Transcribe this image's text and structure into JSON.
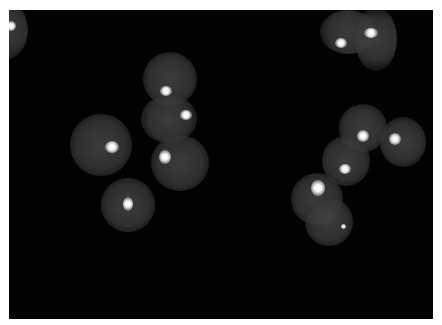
{
  "image": {
    "description": "Fluorescence micrograph of round cell nuclei on a black background, each with a bright focal spot",
    "border_color": "#ffffff",
    "background_color": "#020202",
    "cells": [
      {
        "x": -20,
        "y": 0,
        "w": 48,
        "h": 60,
        "spot": {
          "x": 6,
          "y": 21,
          "w": 10,
          "h": 10
        }
      },
      {
        "x": 143,
        "y": 52,
        "w": 54,
        "h": 54,
        "spot": {
          "x": 160,
          "y": 86,
          "w": 12,
          "h": 10
        }
      },
      {
        "x": 141,
        "y": 95,
        "w": 56,
        "h": 48,
        "spot": {
          "x": 180,
          "y": 110,
          "w": 12,
          "h": 10
        }
      },
      {
        "x": 70,
        "y": 114,
        "w": 62,
        "h": 62,
        "spot": {
          "x": 105,
          "y": 141,
          "w": 14,
          "h": 12
        }
      },
      {
        "x": 151,
        "y": 135,
        "w": 58,
        "h": 56,
        "spot": {
          "x": 159,
          "y": 150,
          "w": 12,
          "h": 14
        }
      },
      {
        "x": 101,
        "y": 178,
        "w": 54,
        "h": 54,
        "spot": {
          "x": 123,
          "y": 197,
          "w": 10,
          "h": 14
        }
      },
      {
        "x": 320,
        "y": 10,
        "w": 56,
        "h": 44,
        "spot": {
          "x": 335,
          "y": 38,
          "w": 12,
          "h": 10
        }
      },
      {
        "x": 355,
        "y": 7,
        "w": 42,
        "h": 64,
        "spot": {
          "x": 364,
          "y": 28,
          "w": 14,
          "h": 10
        }
      },
      {
        "x": 339,
        "y": 104,
        "w": 48,
        "h": 48,
        "spot": {
          "x": 357,
          "y": 130,
          "w": 12,
          "h": 12
        }
      },
      {
        "x": 380,
        "y": 117,
        "w": 46,
        "h": 50,
        "spot": {
          "x": 389,
          "y": 133,
          "w": 12,
          "h": 12
        }
      },
      {
        "x": 322,
        "y": 136,
        "w": 48,
        "h": 50,
        "spot": {
          "x": 339,
          "y": 164,
          "w": 12,
          "h": 10
        }
      },
      {
        "x": 291,
        "y": 173,
        "w": 52,
        "h": 52,
        "spot": {
          "x": 311,
          "y": 180,
          "w": 14,
          "h": 16
        }
      },
      {
        "x": 305,
        "y": 198,
        "w": 48,
        "h": 48,
        "spot": {
          "x": 341,
          "y": 224,
          "w": 5,
          "h": 5
        }
      }
    ]
  }
}
